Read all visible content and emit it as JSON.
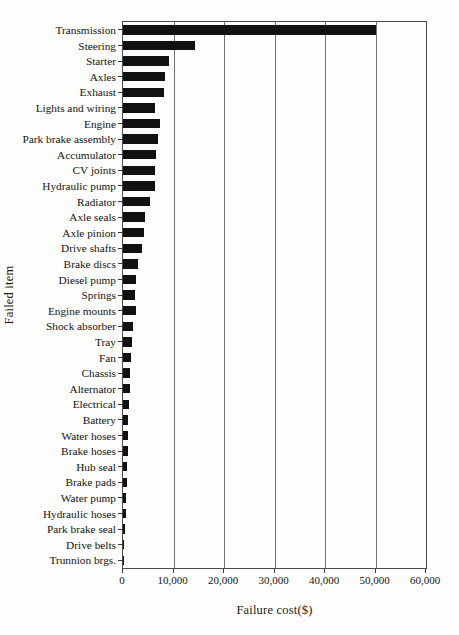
{
  "chart_data": {
    "type": "bar",
    "orientation": "horizontal",
    "title": "",
    "xlabel": "Failure cost($)",
    "ylabel": "Failed item",
    "xlim": [
      0,
      60000
    ],
    "ylim": null,
    "grid": true,
    "grid_axis": "x",
    "legend": null,
    "bar_color": "#111111",
    "axis_color": "#4a4a4a",
    "tick_labels": [
      "0",
      "10,000",
      "20,000",
      "30,000",
      "40,000",
      "50,000",
      "60,000"
    ],
    "tick_values": [
      0,
      10000,
      20000,
      30000,
      40000,
      50000,
      60000
    ],
    "categories": [
      "Transmission",
      "Steering",
      "Starter",
      "Axles",
      "Exhaust",
      "Lights and wiring",
      "Engine",
      "Park brake assembly",
      "Accumulator",
      "CV joints",
      "Hydraulic pump",
      "Radiator",
      "Axle seals",
      "Axle pinion",
      "Drive shafts",
      "Brake discs",
      "Diesel pump",
      "Springs",
      "Engine mounts",
      "Shock absorber",
      "Tray",
      "Fan",
      "Chassis",
      "Alternator",
      "Electrical",
      "Battery",
      "Water hoses",
      "Brake hoses",
      "Hub seal",
      "Brake pads",
      "Water pump",
      "Hydraulic hoses",
      "Park brake seal",
      "Drive belts",
      "Trunnion brgs."
    ],
    "values": [
      50000,
      14200,
      9200,
      8400,
      8100,
      6300,
      7400,
      7000,
      6600,
      6400,
      6300,
      5300,
      4400,
      4200,
      3700,
      3000,
      2500,
      2400,
      2500,
      2000,
      1700,
      1500,
      1400,
      1300,
      1100,
      1000,
      950,
      900,
      800,
      700,
      600,
      500,
      400,
      250,
      150
    ]
  }
}
